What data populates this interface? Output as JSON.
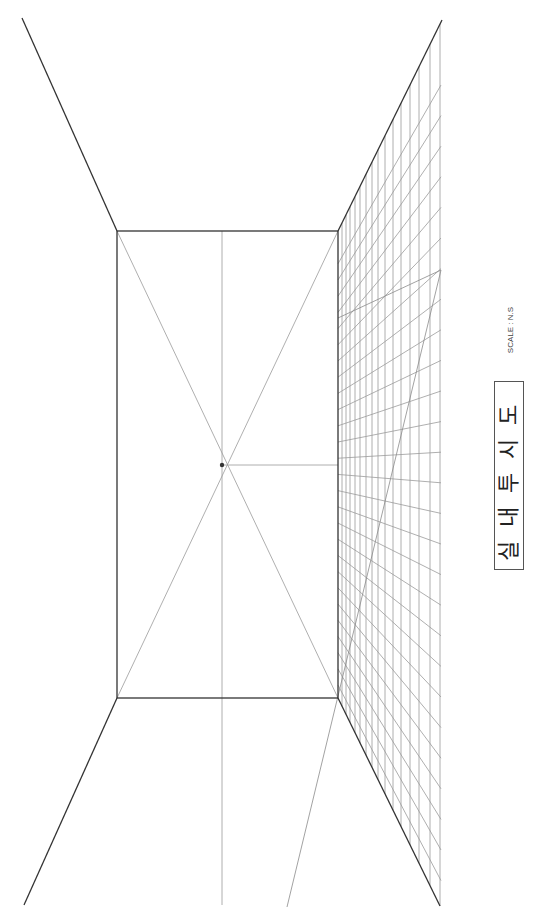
{
  "drawing": {
    "type": "one-point interior perspective",
    "vanishing_point_marker": "dot"
  },
  "title_block": {
    "title": "실내투시도",
    "scale_label": "SCALE : N.S"
  },
  "colors": {
    "outline": "#333333",
    "construction": "#999999",
    "background": "#ffffff"
  }
}
